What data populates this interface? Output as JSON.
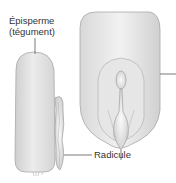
{
  "diagram": {
    "labels": {
      "episperme_line1": "Épisperme",
      "episperme_line2": "(tégument)",
      "radicule": "Radicule"
    },
    "colors": {
      "background": "#ffffff",
      "seed_fill": "#e3e3e3",
      "seed_outline": "#a8a8a8",
      "leader_line": "#555555",
      "text": "#333333"
    }
  }
}
